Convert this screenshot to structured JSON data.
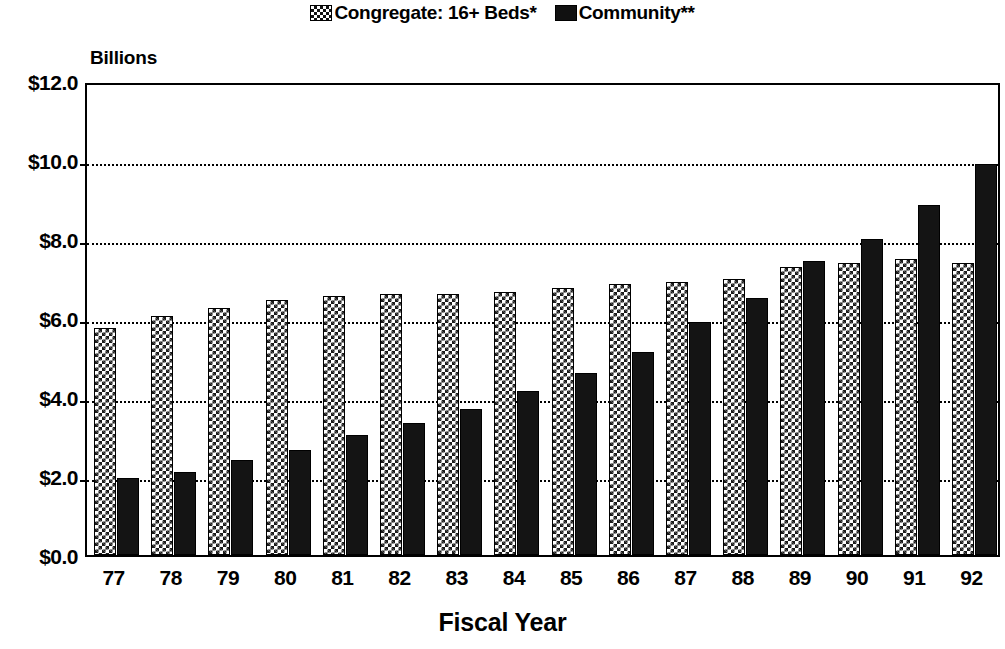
{
  "chart_data": {
    "type": "bar",
    "title": "",
    "xlabel": "Fiscal Year",
    "ylabel": "Billions",
    "units_caption": "Billions",
    "categories": [
      "77",
      "78",
      "79",
      "80",
      "81",
      "82",
      "83",
      "84",
      "85",
      "86",
      "87",
      "88",
      "89",
      "90",
      "91",
      "92"
    ],
    "series": [
      {
        "name": "Congregate: 16+ Beds*",
        "pattern": "checkerboard",
        "color": "#1a1a1a",
        "values": [
          5.75,
          6.05,
          6.25,
          6.45,
          6.55,
          6.6,
          6.6,
          6.65,
          6.75,
          6.85,
          6.9,
          7.0,
          7.3,
          7.4,
          7.5,
          7.4
        ]
      },
      {
        "name": "Community**",
        "pattern": "solid",
        "color": "#141414",
        "values": [
          1.95,
          2.1,
          2.4,
          2.65,
          3.05,
          3.35,
          3.7,
          4.15,
          4.6,
          5.15,
          5.9,
          6.5,
          7.45,
          8.0,
          8.85,
          9.9
        ]
      }
    ],
    "ylim": [
      0,
      12
    ],
    "ytick_values": [
      0,
      2,
      4,
      6,
      8,
      10,
      12
    ],
    "ytick_labels": [
      "$0.0",
      "$2.0",
      "$4.0",
      "$6.0",
      "$8.0",
      "$10.0",
      "$12.0"
    ],
    "grid": true,
    "grid_axis": "y",
    "grid_style": "dotted",
    "legend_position": "top-center",
    "bar_orientation": "vertical"
  },
  "legend": {
    "entries": [
      {
        "label": "Congregate: 16+ Beds*",
        "swatch": "checkerboard-swatch"
      },
      {
        "label": "Community**",
        "swatch": "solid-black-swatch"
      }
    ]
  },
  "axes": {
    "y_units": "Billions",
    "x_title": "Fiscal Year"
  }
}
